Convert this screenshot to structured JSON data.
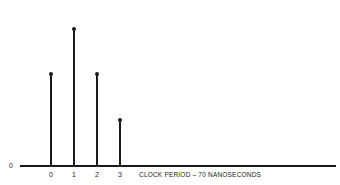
{
  "chart_data": {
    "type": "stem",
    "title": "",
    "xlabel": "CLOCK PERIOD – 70 NANOSECONDS",
    "ylabel": "",
    "y_zero_label": "0",
    "categories": [
      "0",
      "1",
      "2",
      "3"
    ],
    "x": [
      0,
      1,
      2,
      3
    ],
    "values": [
      2,
      3,
      2,
      1
    ],
    "relative_values": [
      0.667,
      1.0,
      0.667,
      0.333
    ],
    "ylim": [
      0,
      3
    ],
    "grid": false,
    "legend": null
  },
  "labels": {
    "zero": "0",
    "ticks": [
      "0",
      "1",
      "2",
      "3"
    ],
    "x_caption": "CLOCK PERIOD – 70 NANOSECONDS"
  }
}
